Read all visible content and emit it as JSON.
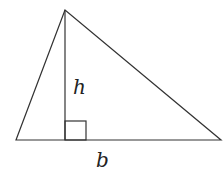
{
  "diagram": {
    "labels": {
      "height": "h",
      "base": "b"
    },
    "colors": {
      "stroke": "#333333",
      "background": "#ffffff"
    },
    "points": {
      "apex": [
        65,
        10
      ],
      "base_left": [
        16,
        140
      ],
      "base_right": [
        221,
        140
      ],
      "foot": [
        65,
        140
      ]
    },
    "right_angle_marker": {
      "x": 65,
      "y": 121,
      "size": 20
    }
  }
}
